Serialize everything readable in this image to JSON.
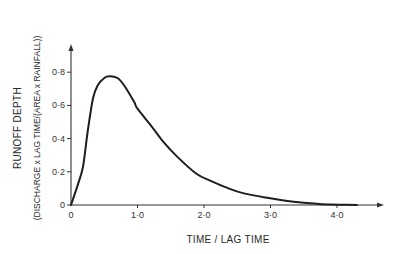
{
  "chart_data": {
    "type": "line",
    "title": "",
    "xlabel": "TIME / LAG TIME",
    "ylabel": "RUNOFF DEPTH",
    "ylabel_sub": "(DISCHARGE x LAG TIME/(AREA x RAINFALL))",
    "xlim": [
      0,
      4.7
    ],
    "ylim": [
      0,
      0.85
    ],
    "x_ticks": [
      0,
      1.0,
      2.0,
      3.0,
      4.0
    ],
    "x_tick_labels": [
      "0",
      "1·0",
      "2·0",
      "3·0",
      "4·0"
    ],
    "y_ticks": [
      0,
      0.2,
      0.4,
      0.6,
      0.8
    ],
    "y_tick_labels": [
      "0",
      "0·2",
      "0·4",
      "0·6",
      "0·8"
    ],
    "grid": false,
    "legend": null,
    "series": [
      {
        "name": "dimensionless unit hydrograph",
        "x": [
          0,
          0.1,
          0.18,
          0.25,
          0.33,
          0.4,
          0.5,
          0.58,
          0.7,
          0.8,
          0.95,
          1.0,
          1.2,
          1.37,
          1.6,
          1.88,
          2.1,
          2.37,
          2.6,
          2.93,
          3.2,
          3.5,
          3.8,
          4.0,
          4.3
        ],
        "y": [
          0,
          0.12,
          0.23,
          0.44,
          0.64,
          0.72,
          0.765,
          0.775,
          0.765,
          0.72,
          0.62,
          0.58,
          0.48,
          0.39,
          0.29,
          0.19,
          0.145,
          0.1,
          0.07,
          0.045,
          0.028,
          0.014,
          0.005,
          0.002,
          0
        ]
      }
    ],
    "peak": {
      "x": 0.6,
      "y": 0.775
    }
  }
}
